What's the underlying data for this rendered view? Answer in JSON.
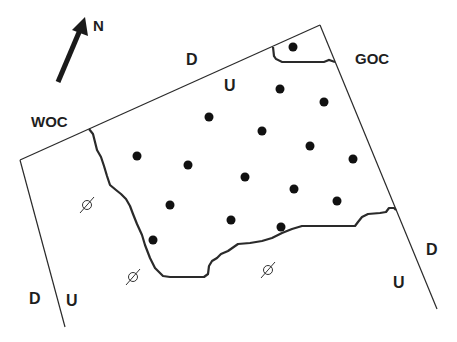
{
  "diagram": {
    "type": "reservoir-fault-block-map",
    "north_arrow": {
      "label": "N",
      "tail": [
        58,
        82
      ],
      "tip": [
        85,
        17
      ]
    },
    "labels": {
      "woc": "WOC",
      "goc": "GOC",
      "top_fault_down": "D",
      "top_fault_up": "U",
      "left_fault_down": "D",
      "left_fault_up": "U",
      "right_fault_down": "D",
      "right_fault_up": "U",
      "dry_symbol": "⌀"
    },
    "colors": {
      "line": "#2a2a2a",
      "text": "#1e1e1e",
      "background": "#ffffff"
    },
    "faults": {
      "top": [
        [
          20,
          160
        ],
        [
          320,
          25
        ]
      ],
      "left": [
        [
          20,
          160
        ],
        [
          65,
          327
        ]
      ],
      "right": [
        [
          320,
          25
        ],
        [
          437,
          309
        ]
      ]
    },
    "wells": [
      [
        293,
        47
      ],
      [
        209,
        117
      ],
      [
        280,
        89
      ],
      [
        324,
        102
      ],
      [
        262,
        131
      ],
      [
        137,
        156
      ],
      [
        188,
        165
      ],
      [
        310,
        146
      ],
      [
        353,
        159
      ],
      [
        245,
        177
      ],
      [
        294,
        189
      ],
      [
        337,
        201
      ],
      [
        170,
        205
      ],
      [
        231,
        220
      ],
      [
        281,
        227
      ],
      [
        153,
        240
      ]
    ],
    "dry_wells": [
      [
        87,
        205
      ],
      [
        133,
        277
      ],
      [
        267,
        270
      ]
    ]
  }
}
